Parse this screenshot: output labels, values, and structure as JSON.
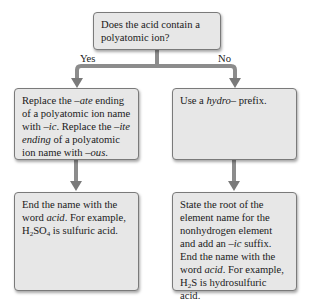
{
  "question": {
    "text": "Does the acid contain a polyatomic ion?"
  },
  "branches": {
    "yes_label": "Yes",
    "no_label": "No"
  },
  "left": {
    "step1": {
      "parts": [
        "Replace the ",
        "–ate",
        " ending of a polyatomic ion name with ",
        "–ic",
        ". Replace the ",
        "–ite",
        " ",
        "ending",
        " of a polyatomic ion name with ",
        "–ous",
        "."
      ]
    },
    "step2": {
      "parts": [
        "End the name with the word ",
        "acid",
        ". For example, H",
        "2",
        "SO",
        "4",
        " is sulfuric acid."
      ]
    }
  },
  "right": {
    "step1": {
      "parts": [
        "Use a ",
        "hydro–",
        " prefix."
      ]
    },
    "step2": {
      "parts": [
        "State the root of the element name for the nonhydrogen element and add an ",
        "–ic",
        " suffix. End the name with the word ",
        "acid",
        ". For example, H",
        "2",
        "S is hydrosulfuric acid."
      ]
    }
  },
  "colors": {
    "box_fill": "#e7e7e7",
    "box_border": "#7a7a7a",
    "arrow": "#8a8a8a"
  }
}
